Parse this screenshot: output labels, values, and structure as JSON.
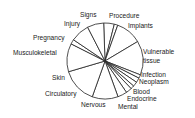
{
  "chart_data": {
    "type": "pie",
    "title": "",
    "start_angle_deg": -90,
    "direction": "clockwise",
    "categories": [
      "Signs",
      "Procedure",
      "Implants",
      "Vulnerable tissue",
      "Infection",
      "Neoplasm",
      "Blood",
      "Endocrine",
      "Mental",
      "Nervous",
      "Circulatory",
      "Skin",
      "Musculokeletal",
      "Pregnancy",
      "Injury",
      "Other (top)"
    ],
    "values": [
      4.5,
      1.5,
      11,
      14.5,
      1.5,
      2,
      2,
      1.5,
      2.5,
      4,
      11,
      15,
      12,
      2,
      8,
      7
    ],
    "legend": "none (labels placed around pie)",
    "colors": {
      "fill": "#ffffff",
      "stroke": "#222222"
    }
  },
  "labels": {
    "signs": "Signs",
    "procedure": "Procedure",
    "implants": "Implants",
    "vulnerable1": "Vulnerable",
    "vulnerable2": "tissue",
    "infection": "Infection",
    "neoplasm": "Neoplasm",
    "blood": "Blood",
    "endocrine": "Endocrine",
    "mental": "Mental",
    "nervous": "Nervous",
    "circulatory": "Circulatory",
    "skin": "Skin",
    "musculo": "Musculokeletal",
    "pregnancy": "Pregnancy",
    "injury": "Injury"
  }
}
